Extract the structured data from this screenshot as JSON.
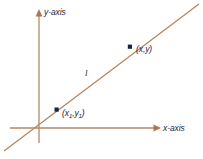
{
  "figure": {
    "background_color": "#ffffff",
    "axis_color": "#b08968",
    "line_color": "#b5835a",
    "marker_color": "#1c2340",
    "text_color": "#1c2340"
  },
  "axes": {
    "y_axis_label": "y-axis",
    "x_axis_label": "x-axis",
    "y_axis_icon": "arrow-up-icon",
    "x_axis_icon": "arrow-right-icon",
    "origin_x": 39,
    "origin_y": 128
  },
  "line": {
    "label": "l",
    "start_x": 4,
    "start_y": 151,
    "end_x": 199,
    "end_y": 4
  },
  "points": [
    {
      "id": "point-x1y1",
      "label_prefix": "(",
      "var_x": "x",
      "sub_x": "1",
      "comma": ",",
      "var_y": "y",
      "sub_y": "1",
      "label_suffix": ")",
      "marker_x": 57,
      "marker_y": 110
    },
    {
      "id": "point-xy",
      "label": "(x,y)",
      "marker_x": 130,
      "marker_y": 47
    }
  ]
}
